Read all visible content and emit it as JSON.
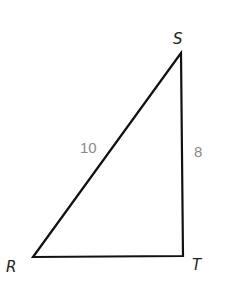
{
  "diagram": {
    "type": "right-triangle",
    "vertices": [
      {
        "name": "S",
        "label": "S",
        "x": 181,
        "y": 53
      },
      {
        "name": "R",
        "label": "R",
        "x": 33,
        "y": 257
      },
      {
        "name": "T",
        "label": "T",
        "x": 183,
        "y": 256
      }
    ],
    "sides": [
      {
        "between": "RS",
        "length_label": "10"
      },
      {
        "between": "ST",
        "length_label": "8"
      },
      {
        "between": "RT",
        "length_label": ""
      }
    ],
    "colors": {
      "stroke": "#111111",
      "vertex_label": "#222222",
      "side_label": "#8a8a8a"
    }
  }
}
